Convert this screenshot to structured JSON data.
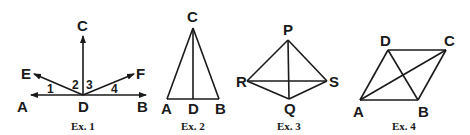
{
  "figures": [
    {
      "caption": "Ex. 1",
      "points": {
        "A": "A",
        "B": "B",
        "C": "C",
        "D": "D",
        "E": "E",
        "F": "F"
      },
      "angles": [
        "1",
        "2",
        "3",
        "4"
      ]
    },
    {
      "caption": "Ex. 2",
      "points": {
        "A": "A",
        "B": "B",
        "C": "C",
        "D": "D"
      }
    },
    {
      "caption": "Ex. 3",
      "points": {
        "P": "P",
        "Q": "Q",
        "R": "R",
        "S": "S"
      }
    },
    {
      "caption": "Ex. 4",
      "points": {
        "A": "A",
        "B": "B",
        "C": "C",
        "D": "D"
      }
    }
  ],
  "colors": {
    "ink": "#1a1a1a",
    "background": "#ffffff"
  }
}
